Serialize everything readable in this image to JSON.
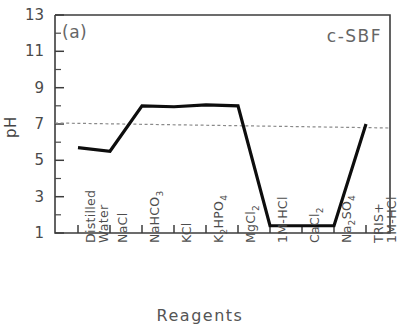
{
  "chart_data": {
    "type": "line",
    "title": "",
    "panel_label": "(a)",
    "series_label": "c-SBF",
    "xlabel": "Reagents",
    "ylabel": "pH",
    "ylim": [
      1,
      13
    ],
    "yticks": [
      1,
      3,
      5,
      7,
      9,
      11,
      13
    ],
    "yticks_minor": [
      2,
      4,
      6,
      8,
      10,
      12
    ],
    "grid": false,
    "legend_position": "none",
    "categories": [
      "Distilled Water",
      "NaCl",
      "NaHCO3",
      "KCl",
      "K2HPO4",
      "MgCl2",
      "1M-HCl",
      "CaCl2",
      "Na2SO4",
      "TRIS+ 1M-HCl"
    ],
    "series": [
      {
        "name": "c-SBF",
        "values": [
          5.7,
          5.5,
          8.0,
          7.95,
          8.05,
          8.0,
          1.4,
          1.4,
          1.4,
          7.0
        ]
      }
    ],
    "reference_line": {
      "label": "pH 7",
      "value": 7,
      "style": "dashed"
    },
    "colors": {
      "line": "#111111",
      "reference": "#777777",
      "axis": "#444444",
      "text": "#4a4a4a"
    }
  },
  "axis": {
    "y_tick_labels": [
      "13",
      "11",
      "9",
      "7",
      "5",
      "3",
      "1"
    ],
    "x_tick_labels": [
      {
        "l1": "Distilled",
        "l2": "Water"
      },
      {
        "l1": "NaCl",
        "l2": ""
      },
      {
        "l1": "NaHCO",
        "sub": "3",
        "l2": ""
      },
      {
        "l1": "KCl",
        "l2": ""
      },
      {
        "l1": "K",
        "sub": "2",
        "mid": "HPO",
        "sub2": "4",
        "l2": ""
      },
      {
        "l1": "MgCl",
        "sub": "2",
        "l2": ""
      },
      {
        "l1": "1M-HCl",
        "l2": ""
      },
      {
        "l1": "CaCl",
        "sub": "2",
        "l2": ""
      },
      {
        "l1": "Na",
        "sub": "2",
        "mid": "SO",
        "sub2": "4",
        "l2": ""
      },
      {
        "l1": "TRIS+",
        "l2": "1M-HCl"
      }
    ]
  }
}
